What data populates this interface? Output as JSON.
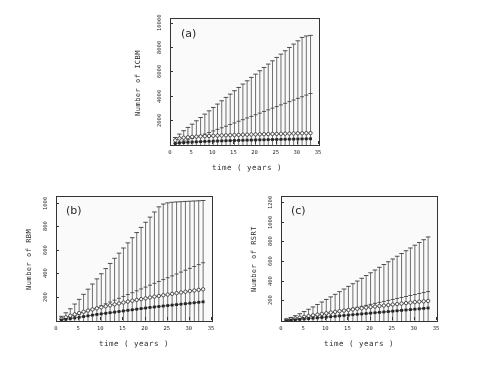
{
  "figure": {
    "panels": [
      {
        "tag": "(a)",
        "ylabel": "Number of ICBM",
        "xlabel": "time ( years )",
        "yticks": [
          2000,
          4000,
          6000,
          8000,
          10000
        ],
        "xticks": [
          0,
          5,
          10,
          15,
          20,
          25,
          30,
          35
        ]
      },
      {
        "tag": "(b)",
        "ylabel": "Number of RBM",
        "xlabel": "time ( years )",
        "yticks": [
          200,
          400,
          600,
          800,
          1000
        ],
        "xticks": [
          0,
          5,
          10,
          15,
          20,
          25,
          30,
          35
        ]
      },
      {
        "tag": "(c)",
        "ylabel": "Number of RSRT",
        "xlabel": "time ( years )",
        "yticks": [
          200,
          400,
          600,
          800,
          1000,
          1200
        ],
        "xticks": [
          0,
          5,
          10,
          15,
          20,
          25,
          30,
          35
        ]
      }
    ]
  },
  "chart_data": [
    {
      "type": "line",
      "title": "(a)",
      "xlabel": "time ( years )",
      "ylabel": "Number of ICBM",
      "xlim": [
        0,
        35
      ],
      "ylim": [
        0,
        10400
      ],
      "yticks": [
        2000,
        4000,
        6000,
        8000,
        10000
      ],
      "xticks": [
        0,
        5,
        10,
        15,
        20,
        25,
        30,
        35
      ],
      "grid": false,
      "legend": "none",
      "x": [
        1,
        2,
        3,
        4,
        5,
        6,
        7,
        8,
        9,
        10,
        11,
        12,
        13,
        14,
        15,
        16,
        17,
        18,
        19,
        20,
        21,
        22,
        23,
        24,
        25,
        26,
        27,
        28,
        29,
        30,
        31,
        32,
        33
      ],
      "series": [
        {
          "name": "mean with error bars",
          "marker": "errorbar",
          "values": [
            140,
            230,
            330,
            430,
            540,
            660,
            780,
            900,
            1030,
            1160,
            1290,
            1420,
            1550,
            1690,
            1820,
            1960,
            2090,
            2230,
            2360,
            2500,
            2630,
            2770,
            2900,
            3040,
            3170,
            3310,
            3440,
            3580,
            3710,
            3850,
            3980,
            4120,
            4250
          ],
          "err_upper": [
            620,
            900,
            1180,
            1450,
            1720,
            2000,
            2270,
            2550,
            2820,
            3100,
            3380,
            3650,
            3930,
            4200,
            4480,
            4750,
            5030,
            5300,
            5580,
            5850,
            6130,
            6400,
            6680,
            6950,
            7230,
            7500,
            7780,
            8050,
            8330,
            8600,
            8880,
            9000,
            9050
          ],
          "err_lower": [
            0,
            0,
            0,
            0,
            0,
            0,
            0,
            0,
            0,
            0,
            0,
            0,
            0,
            0,
            0,
            0,
            0,
            0,
            0,
            0,
            0,
            0,
            0,
            0,
            0,
            0,
            0,
            0,
            0,
            0,
            0,
            0,
            0
          ]
        },
        {
          "name": "open circle series",
          "marker": "open-circle",
          "values": [
            380,
            540,
            600,
            640,
            670,
            690,
            710,
            730,
            745,
            760,
            775,
            790,
            800,
            812,
            824,
            836,
            846,
            856,
            866,
            876,
            885,
            894,
            903,
            912,
            920,
            928,
            936,
            944,
            952,
            960,
            968,
            976,
            984
          ]
        },
        {
          "name": "filled square series",
          "marker": "filled-square",
          "values": [
            120,
            170,
            200,
            225,
            245,
            262,
            278,
            292,
            305,
            318,
            330,
            341,
            352,
            362,
            372,
            382,
            391,
            400,
            409,
            418,
            426,
            434,
            442,
            450,
            458,
            466,
            473,
            480,
            487,
            494,
            501,
            508,
            515
          ]
        }
      ]
    },
    {
      "type": "line",
      "title": "(b)",
      "xlabel": "time ( years )",
      "ylabel": "Number of RBM",
      "xlim": [
        0,
        35
      ],
      "ylim": [
        0,
        1060
      ],
      "yticks": [
        200,
        400,
        600,
        800,
        1000
      ],
      "xticks": [
        0,
        5,
        10,
        15,
        20,
        25,
        30,
        35
      ],
      "grid": false,
      "legend": "none",
      "x": [
        1,
        2,
        3,
        4,
        5,
        6,
        7,
        8,
        9,
        10,
        11,
        12,
        13,
        14,
        15,
        16,
        17,
        18,
        19,
        20,
        21,
        22,
        23,
        24,
        25,
        26,
        27,
        28,
        29,
        30,
        31,
        32,
        33
      ],
      "series": [
        {
          "name": "mean with error bars",
          "marker": "errorbar",
          "values": [
            12,
            22,
            33,
            45,
            58,
            72,
            86,
            101,
            116,
            131,
            147,
            162,
            178,
            194,
            210,
            226,
            242,
            258,
            274,
            290,
            306,
            322,
            338,
            354,
            370,
            386,
            402,
            418,
            434,
            450,
            466,
            482,
            498
          ],
          "err_upper": [
            40,
            70,
            105,
            145,
            185,
            228,
            272,
            316,
            360,
            404,
            448,
            492,
            536,
            580,
            624,
            668,
            712,
            756,
            800,
            844,
            888,
            932,
            976,
            1000,
            1010,
            1015,
            1018,
            1020,
            1022,
            1024,
            1026,
            1028,
            1030
          ],
          "err_lower": [
            0,
            0,
            0,
            0,
            0,
            0,
            0,
            0,
            0,
            0,
            0,
            0,
            0,
            0,
            0,
            0,
            0,
            0,
            0,
            0,
            0,
            0,
            0,
            0,
            0,
            0,
            0,
            0,
            0,
            0,
            0,
            0,
            0
          ]
        },
        {
          "name": "open circle series",
          "marker": "open-circle",
          "values": [
            18,
            32,
            45,
            57,
            68,
            79,
            89,
            99,
            108,
            117,
            126,
            134,
            142,
            150,
            158,
            166,
            173,
            180,
            187,
            194,
            201,
            208,
            214,
            220,
            226,
            232,
            238,
            244,
            250,
            256,
            261,
            266,
            271
          ]
        },
        {
          "name": "filled square series",
          "marker": "filled-square",
          "values": [
            8,
            14,
            20,
            26,
            32,
            38,
            44,
            50,
            56,
            61,
            66,
            71,
            76,
            81,
            86,
            91,
            96,
            101,
            106,
            111,
            116,
            120,
            124,
            128,
            132,
            136,
            140,
            144,
            148,
            152,
            156,
            160,
            164
          ]
        }
      ]
    },
    {
      "type": "line",
      "title": "(c)",
      "xlabel": "time ( years )",
      "ylabel": "Number of RSRT",
      "xlim": [
        0,
        35
      ],
      "ylim": [
        0,
        1260
      ],
      "yticks": [
        200,
        400,
        600,
        800,
        1000,
        1200
      ],
      "xticks": [
        0,
        5,
        10,
        15,
        20,
        25,
        30,
        35
      ],
      "grid": false,
      "legend": "none",
      "x": [
        1,
        2,
        3,
        4,
        5,
        6,
        7,
        8,
        9,
        10,
        11,
        12,
        13,
        14,
        15,
        16,
        17,
        18,
        19,
        20,
        21,
        22,
        23,
        24,
        25,
        26,
        27,
        28,
        29,
        30,
        31,
        32,
        33
      ],
      "series": [
        {
          "name": "mean with error bars",
          "marker": "errorbar",
          "values": [
            6,
            11,
            17,
            24,
            31,
            39,
            47,
            55,
            64,
            73,
            82,
            91,
            100,
            110,
            119,
            129,
            139,
            149,
            159,
            169,
            179,
            189,
            199,
            209,
            219,
            229,
            239,
            249,
            259,
            269,
            279,
            289,
            299
          ],
          "err_upper": [
            20,
            36,
            54,
            74,
            96,
            119,
            143,
            168,
            193,
            219,
            245,
            271,
            298,
            325,
            352,
            379,
            406,
            434,
            462,
            490,
            518,
            546,
            574,
            602,
            630,
            658,
            686,
            714,
            742,
            770,
            798,
            826,
            854
          ],
          "err_lower": [
            0,
            0,
            0,
            0,
            0,
            0,
            0,
            0,
            0,
            0,
            0,
            0,
            0,
            0,
            0,
            0,
            0,
            0,
            0,
            0,
            0,
            0,
            0,
            0,
            0,
            0,
            0,
            0,
            0,
            0,
            0,
            0,
            0
          ]
        },
        {
          "name": "open circle series",
          "marker": "open-circle",
          "values": [
            10,
            18,
            26,
            34,
            42,
            50,
            58,
            65,
            72,
            79,
            86,
            93,
            100,
            106,
            112,
            118,
            124,
            130,
            136,
            142,
            147,
            152,
            157,
            162,
            167,
            172,
            177,
            182,
            187,
            192,
            196,
            200,
            204
          ]
        },
        {
          "name": "filled square series",
          "marker": "filled-square",
          "values": [
            4,
            8,
            12,
            16,
            20,
            24,
            28,
            32,
            36,
            40,
            44,
            48,
            52,
            56,
            60,
            64,
            68,
            72,
            76,
            80,
            84,
            88,
            92,
            96,
            100,
            104,
            108,
            112,
            116,
            120,
            124,
            128,
            132
          ]
        }
      ]
    }
  ]
}
